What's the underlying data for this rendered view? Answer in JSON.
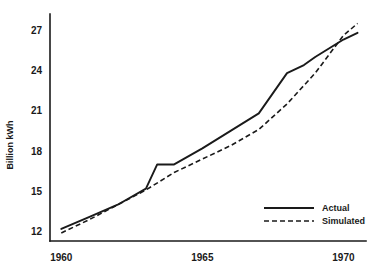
{
  "chart_data": {
    "type": "line",
    "title": "",
    "subtitle": "",
    "xlabel": "",
    "ylabel": "Billion kWh",
    "xlim": [
      1959.6,
      1970.8
    ],
    "ylim": [
      11.3,
      28.2
    ],
    "yticks": [
      12,
      15,
      18,
      21,
      24,
      27
    ],
    "xticks": [
      1960,
      1965,
      1970
    ],
    "ytick_labels": [
      "12",
      "15",
      "18",
      "21",
      "24",
      "27"
    ],
    "xtick_labels": [
      "1960",
      "1965",
      "1970"
    ],
    "grid": false,
    "legend_position": "lower-right",
    "legend_entries": [
      "Actual",
      "Simulated"
    ],
    "x": [
      1960,
      1961,
      1962,
      1963,
      1963.4,
      1964,
      1965,
      1966,
      1967,
      1968,
      1968.6,
      1969,
      1970,
      1970.5
    ],
    "series": [
      {
        "name": "Actual",
        "style": "solid",
        "color": "#1a1a1a",
        "x": [
          1960,
          1961,
          1962,
          1963,
          1963.4,
          1964,
          1965,
          1966,
          1967,
          1968,
          1968.6,
          1969,
          1970,
          1970.5
        ],
        "values": [
          12.2,
          13.1,
          14.0,
          15.2,
          17.0,
          17.0,
          18.2,
          19.5,
          20.8,
          23.8,
          24.4,
          25.0,
          26.3,
          26.8
        ]
      },
      {
        "name": "Simulated",
        "style": "dashed",
        "color": "#1a1a1a",
        "x": [
          1960,
          1961,
          1962,
          1963,
          1964,
          1965,
          1966,
          1967,
          1968,
          1969,
          1970,
          1970.5
        ],
        "values": [
          11.9,
          12.9,
          14.0,
          15.1,
          16.4,
          17.4,
          18.4,
          19.6,
          21.5,
          23.8,
          26.6,
          27.5
        ]
      }
    ]
  },
  "axis_label": {
    "y": "Billion kWh"
  },
  "legend": {
    "items": [
      {
        "label": "Actual",
        "style": "solid"
      },
      {
        "label": "Simulated",
        "style": "dashed"
      }
    ]
  },
  "colors": {
    "ink": "#1a1a1a",
    "background": "#ffffff"
  }
}
